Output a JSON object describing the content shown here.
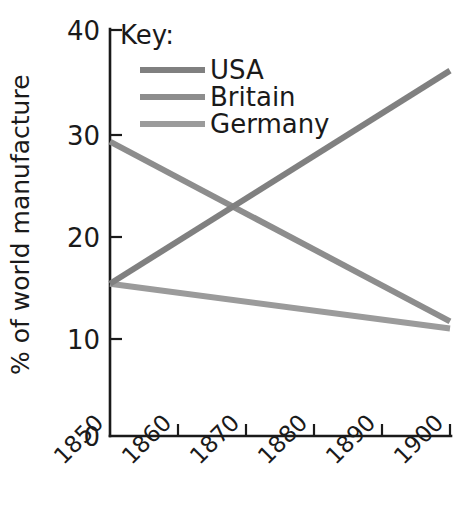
{
  "chart_data": {
    "type": "line",
    "title": "",
    "subtitle": "",
    "xlabel": "",
    "ylabel": "% of world manufacture",
    "x": [
      1850,
      1900
    ],
    "xtick_labels": [
      "1850",
      "1860",
      "1870",
      "1880",
      "1890",
      "1900"
    ],
    "xticks": [
      1850,
      1860,
      1870,
      1880,
      1890,
      1900
    ],
    "ytick_labels": [
      "0",
      "10",
      "20",
      "30",
      "40"
    ],
    "yticks": [
      0,
      10,
      20,
      30,
      40
    ],
    "xlim": [
      1850,
      1900
    ],
    "ylim": [
      0,
      40
    ],
    "grid": false,
    "legend_position": "top-right-inside",
    "legend_title": "Key:",
    "annotations": [],
    "series": [
      {
        "name": "USA",
        "color": "#808080",
        "x": [
          1850,
          1900
        ],
        "values": [
          15,
          36
        ]
      },
      {
        "name": "Britain",
        "color": "#8d8d8d",
        "x": [
          1850,
          1900
        ],
        "values": [
          29,
          11.3
        ]
      },
      {
        "name": "Germany",
        "color": "#9b9b9b",
        "x": [
          1850,
          1900
        ],
        "values": [
          15,
          10.6
        ]
      }
    ]
  },
  "axis": {
    "y_title": "% of world manufacture",
    "y_labels": {
      "t40": "40",
      "t30": "30",
      "t20": "20",
      "t10": "10",
      "t0": "0"
    },
    "x_labels": {
      "t1850": "1850",
      "t1860": "1860",
      "t1870": "1870",
      "t1880": "1880",
      "t1890": "1890",
      "t1900": "1900"
    }
  },
  "legend": {
    "title": "Key:",
    "items": [
      {
        "label": "USA",
        "color": "#808080"
      },
      {
        "label": "Britain",
        "color": "#8d8d8d"
      },
      {
        "label": "Germany",
        "color": "#9b9b9b"
      }
    ]
  },
  "colors": {
    "axis": "#1a1a1a",
    "background": "#ffffff",
    "usa": "#808080",
    "britain": "#8d8d8d",
    "germany": "#9b9b9b"
  }
}
